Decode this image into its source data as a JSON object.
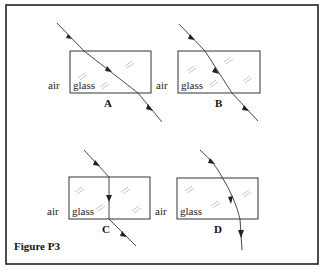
{
  "figure": {
    "caption": "Figure P3",
    "medium_outside": "air",
    "medium_inside": "glass"
  },
  "panels": [
    {
      "id": "A",
      "label": "A",
      "left_label": "air",
      "inner_label": "glass"
    },
    {
      "id": "B",
      "label": "B",
      "left_label": "air",
      "inner_label": "glass"
    },
    {
      "id": "C",
      "label": "C",
      "left_label": "air",
      "inner_label": "glass"
    },
    {
      "id": "D",
      "label": "D",
      "left_label": "air",
      "inner_label": "glass"
    }
  ],
  "colors": {
    "line": "#333333",
    "frame": "#222222",
    "hatch": "#aaaaaa"
  }
}
